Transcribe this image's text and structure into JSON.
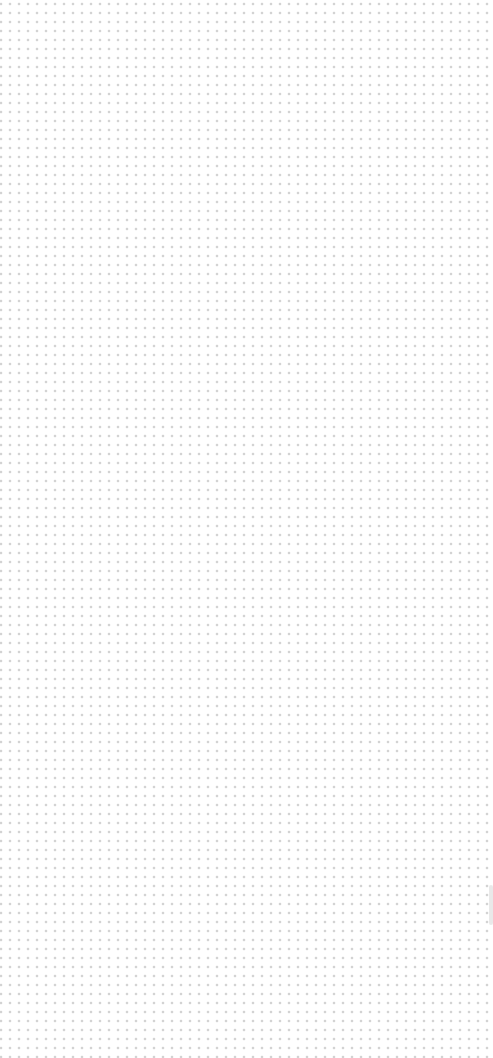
{
  "canvas": {
    "pattern": "dot-grid",
    "dot_spacing_px": 9,
    "dot_color": "#8a8a8a",
    "background_color": "#ffffff"
  },
  "scrollbar": {
    "visible": true,
    "color": "#e4e4e4"
  }
}
